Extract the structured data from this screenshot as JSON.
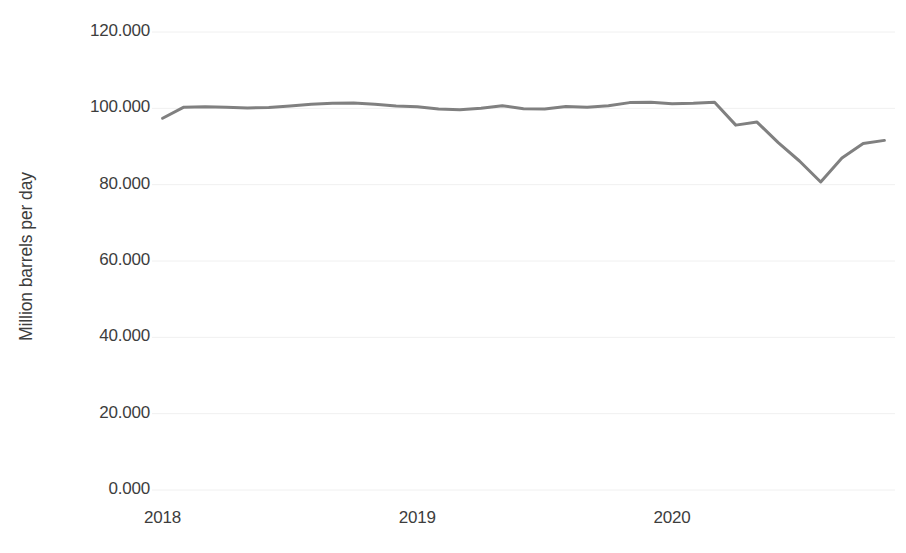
{
  "chart_data": {
    "type": "line",
    "title": "",
    "subtitle": "",
    "xlabel": "",
    "ylabel": "Million barrels per day",
    "ylim": [
      0,
      120
    ],
    "ytick_labels": [
      "120.000",
      "100.000",
      "80.000",
      "60.000",
      "40.000",
      "20.000",
      "0.000"
    ],
    "ytick_values": [
      120,
      100,
      80,
      60,
      40,
      20,
      0
    ],
    "xtick_labels": [
      "2018",
      "2019",
      "2020"
    ],
    "xtick_values": [
      2018,
      2019,
      2020
    ],
    "xlim": [
      2018.0,
      2020.92
    ],
    "grid": true,
    "grid_axis": "y",
    "grid_color": "#f0f0f0",
    "legend": false,
    "legend_position": "none",
    "series": [
      {
        "name": "World liquid fuels supply",
        "color": "#808080",
        "line_width": 3,
        "markers": false,
        "x": [
          "2018-01",
          "2018-02",
          "2018-03",
          "2018-04",
          "2018-05",
          "2018-06",
          "2018-07",
          "2018-08",
          "2018-09",
          "2018-10",
          "2018-11",
          "2018-12",
          "2019-01",
          "2019-02",
          "2019-03",
          "2019-04",
          "2019-05",
          "2019-06",
          "2019-07",
          "2019-08",
          "2019-09",
          "2019-10",
          "2019-11",
          "2019-12",
          "2020-01",
          "2020-02",
          "2020-03",
          "2020-04",
          "2020-05",
          "2020-06",
          "2020-07",
          "2020-08",
          "2020-09",
          "2020-10",
          "2020-11"
        ],
        "values": [
          97.4,
          100.3,
          100.4,
          100.3,
          100.1,
          100.2,
          100.6,
          101.1,
          101.3,
          101.4,
          101.1,
          100.6,
          100.4,
          99.8,
          99.6,
          100.0,
          100.7,
          99.9,
          99.8,
          100.5,
          100.3,
          100.7,
          101.5,
          101.6,
          101.2,
          101.3,
          101.6,
          95.6,
          96.4,
          91.0,
          86.2,
          80.7,
          87.0,
          90.8,
          91.6
        ]
      }
    ]
  },
  "footer": {
    "cut_off_text": ""
  }
}
